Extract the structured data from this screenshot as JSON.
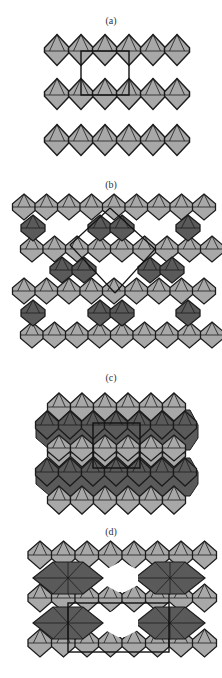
{
  "figure": {
    "panels": [
      {
        "id": "a",
        "label": "(a)",
        "label_y": 15
      },
      {
        "id": "b",
        "label": "(b)",
        "label_y": 179
      },
      {
        "id": "c",
        "label": "(c)",
        "label_y": 372
      },
      {
        "id": "d",
        "label": "(d)",
        "label_y": 526
      }
    ],
    "colors": {
      "light_polyhedron": "#a8a8a8",
      "dark_polyhedron": "#5a5a5a",
      "edge": "#1c1c1c",
      "unit_cell": "#111111",
      "background": "#ffffff"
    }
  }
}
